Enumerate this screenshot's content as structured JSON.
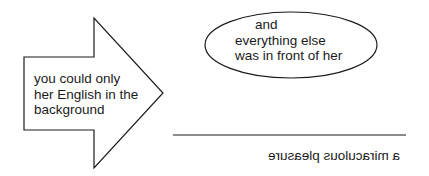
{
  "arrow": {
    "lines": [
      "you could only",
      "her English in the",
      "background"
    ]
  },
  "ellipse": {
    "lines": [
      "and",
      "everything else",
      "was in front of her"
    ]
  },
  "underline_caption": {
    "text": "a miraculous pleasure",
    "mirrored": true
  },
  "colors": {
    "stroke": "#1a1a1a",
    "background": "#ffffff"
  }
}
